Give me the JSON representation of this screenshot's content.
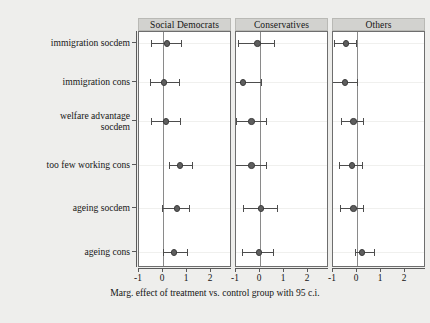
{
  "figure": {
    "background_color": "#eeeeec",
    "panel_color": "#ffffff",
    "strip_color": "#d2d2cf",
    "point_color": "#5e5e5e",
    "zero_line_color": "#8a8a8a"
  },
  "chart_data": {
    "type": "scatter",
    "title": "",
    "xlabel": "Marg. effect of treatment vs. control group with 95 c.i.",
    "ylabel": "",
    "xlim": [
      -1.45,
      2.35
    ],
    "xticks": [
      -1,
      0,
      1,
      2
    ],
    "xticklabels": [
      "-1",
      "0",
      "1",
      "2"
    ],
    "grid": false,
    "legend": "none",
    "reference_line": 0,
    "categories": [
      "immigration socdem",
      "immigration cons",
      "welfare advantage\nsocdem",
      "too few working cons",
      "ageing socdem",
      "ageing cons"
    ],
    "panels": [
      {
        "label": "Social Democrats",
        "points": [
          {
            "category": "immigration socdem",
            "estimate": 0.17,
            "ci_low": -0.5,
            "ci_high": 0.75
          },
          {
            "category": "immigration cons",
            "estimate": 0.05,
            "ci_low": -0.55,
            "ci_high": 0.65
          },
          {
            "category": "welfare advantage socdem",
            "estimate": 0.13,
            "ci_low": -0.5,
            "ci_high": 0.7
          },
          {
            "category": "too few working cons",
            "estimate": 0.7,
            "ci_low": 0.25,
            "ci_high": 1.2
          },
          {
            "category": "ageing socdem",
            "estimate": 0.58,
            "ci_low": -0.05,
            "ci_high": 1.1
          },
          {
            "category": "ageing cons",
            "estimate": 0.45,
            "ci_low": -0.02,
            "ci_high": 1.0
          }
        ]
      },
      {
        "label": "Conservatives",
        "points": [
          {
            "category": "immigration socdem",
            "estimate": -0.1,
            "ci_low": -0.9,
            "ci_high": 0.6
          },
          {
            "category": "immigration cons",
            "estimate": -0.72,
            "ci_low": -1.35,
            "ci_high": 0.05
          },
          {
            "category": "welfare advantage socdem",
            "estimate": -0.35,
            "ci_low": -1.0,
            "ci_high": 0.25
          },
          {
            "category": "too few working cons",
            "estimate": -0.35,
            "ci_low": -1.05,
            "ci_high": 0.25
          },
          {
            "category": "ageing socdem",
            "estimate": 0.05,
            "ci_low": -0.7,
            "ci_high": 0.7
          },
          {
            "category": "ageing cons",
            "estimate": -0.05,
            "ci_low": -0.75,
            "ci_high": 0.55
          }
        ]
      },
      {
        "label": "Others",
        "points": [
          {
            "category": "immigration socdem",
            "estimate": -0.45,
            "ci_low": -0.95,
            "ci_high": -0.05
          },
          {
            "category": "immigration cons",
            "estimate": -0.5,
            "ci_low": -1.05,
            "ci_high": 0.0
          },
          {
            "category": "welfare advantage socdem",
            "estimate": -0.15,
            "ci_low": -0.65,
            "ci_high": 0.25
          },
          {
            "category": "too few working cons",
            "estimate": -0.2,
            "ci_low": -0.75,
            "ci_high": 0.2
          },
          {
            "category": "ageing socdem",
            "estimate": -0.15,
            "ci_low": -0.7,
            "ci_high": 0.25
          },
          {
            "category": "ageing cons",
            "estimate": 0.2,
            "ci_low": -0.1,
            "ci_high": 0.7
          }
        ]
      }
    ]
  }
}
